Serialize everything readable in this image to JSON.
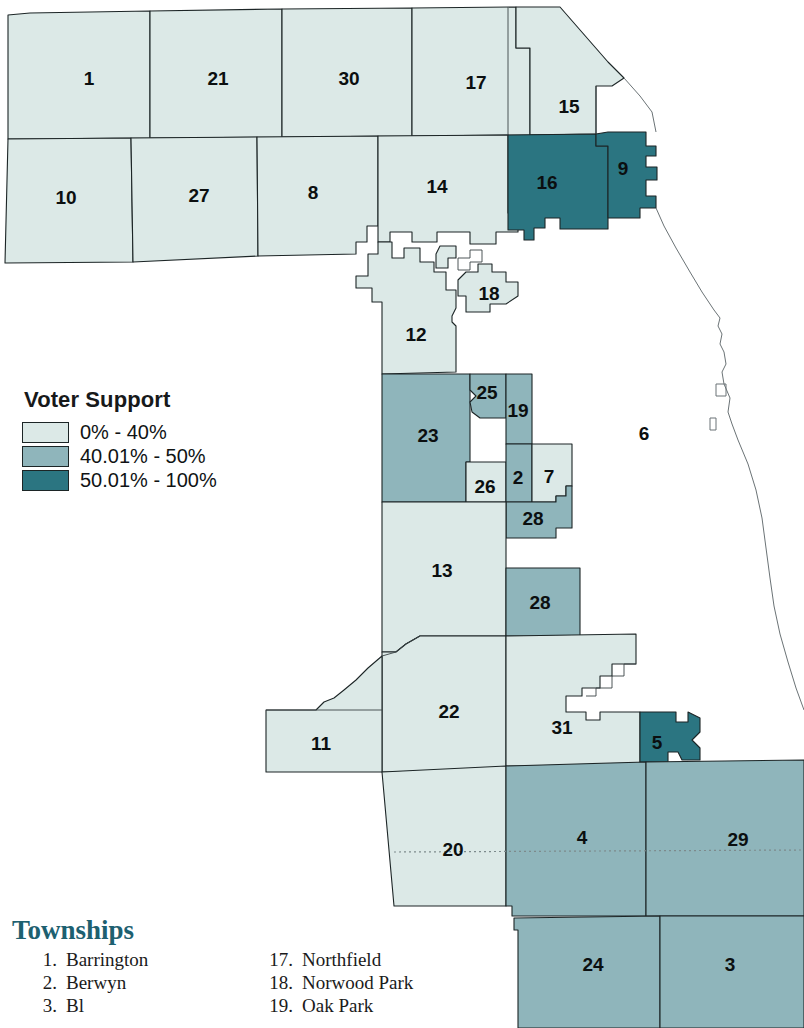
{
  "legend": {
    "title": "Voter Support",
    "entries": [
      {
        "label": "0% - 40%",
        "color": "#dce9e7",
        "level": "low"
      },
      {
        "label": "40.01% - 50%",
        "color": "#8fb5bb",
        "level": "mid"
      },
      {
        "label": "50.01% - 100%",
        "color": "#2b7581",
        "level": "high"
      }
    ]
  },
  "townships": {
    "heading": "Townships",
    "col_left": [
      {
        "num": "1.",
        "name": "Barrington"
      },
      {
        "num": "2.",
        "name": "Berwyn"
      },
      {
        "num": "3.",
        "name": "Bl"
      }
    ],
    "col_right": [
      {
        "num": "17.",
        "name": "Northfield"
      },
      {
        "num": "18.",
        "name": "Norwood Park"
      },
      {
        "num": "19.",
        "name": "Oak Park"
      }
    ]
  },
  "map": {
    "regions": [
      {
        "id": "1",
        "label": "1",
        "level": "low",
        "lx": 89,
        "ly": 80
      },
      {
        "id": "21",
        "label": "21",
        "level": "low",
        "lx": 218,
        "ly": 80
      },
      {
        "id": "30",
        "label": "30",
        "level": "low",
        "lx": 349,
        "ly": 80
      },
      {
        "id": "17",
        "label": "17",
        "level": "low",
        "lx": 476,
        "ly": 84
      },
      {
        "id": "15",
        "label": "15",
        "level": "low",
        "lx": 569,
        "ly": 108
      },
      {
        "id": "10",
        "label": "10",
        "level": "low",
        "lx": 66,
        "ly": 199
      },
      {
        "id": "27",
        "label": "27",
        "level": "low",
        "lx": 199,
        "ly": 197
      },
      {
        "id": "8",
        "label": "8",
        "level": "low",
        "lx": 313,
        "ly": 194
      },
      {
        "id": "14",
        "label": "14",
        "level": "low",
        "lx": 437,
        "ly": 188
      },
      {
        "id": "16",
        "label": "16",
        "level": "high",
        "lx": 547,
        "ly": 184
      },
      {
        "id": "9",
        "label": "9",
        "level": "high",
        "lx": 623,
        "ly": 170
      },
      {
        "id": "18",
        "label": "18",
        "level": "low",
        "lx": 489,
        "ly": 295
      },
      {
        "id": "12",
        "label": "12",
        "level": "low",
        "lx": 416,
        "ly": 336
      },
      {
        "id": "25",
        "label": "25",
        "level": "mid",
        "lx": 487,
        "ly": 394
      },
      {
        "id": "19",
        "label": "19",
        "level": "mid",
        "lx": 518,
        "ly": 412
      },
      {
        "id": "23",
        "label": "23",
        "level": "mid",
        "lx": 428,
        "ly": 437
      },
      {
        "id": "6",
        "label": "6",
        "level": "none",
        "lx": 644,
        "ly": 435
      },
      {
        "id": "26",
        "label": "26",
        "level": "low",
        "lx": 485,
        "ly": 488
      },
      {
        "id": "2",
        "label": "2",
        "level": "mid",
        "lx": 518,
        "ly": 479
      },
      {
        "id": "7",
        "label": "7",
        "level": "low",
        "lx": 549,
        "ly": 478
      },
      {
        "id": "28a",
        "label": "28",
        "level": "mid",
        "lx": 533,
        "ly": 520
      },
      {
        "id": "13",
        "label": "13",
        "level": "low",
        "lx": 442,
        "ly": 572
      },
      {
        "id": "28b",
        "label": "28",
        "level": "mid",
        "lx": 540,
        "ly": 604
      },
      {
        "id": "22",
        "label": "22",
        "level": "low",
        "lx": 449,
        "ly": 713
      },
      {
        "id": "11",
        "label": "11",
        "level": "low",
        "lx": 321,
        "ly": 745
      },
      {
        "id": "31",
        "label": "31",
        "level": "low",
        "lx": 562,
        "ly": 729
      },
      {
        "id": "5",
        "label": "5",
        "level": "high",
        "lx": 657,
        "ly": 744
      },
      {
        "id": "20",
        "label": "20",
        "level": "low",
        "lx": 453,
        "ly": 851
      },
      {
        "id": "4",
        "label": "4",
        "level": "mid",
        "lx": 582,
        "ly": 839
      },
      {
        "id": "29",
        "label": "29",
        "level": "mid",
        "lx": 738,
        "ly": 841
      },
      {
        "id": "24",
        "label": "24",
        "level": "mid",
        "lx": 593,
        "ly": 966
      },
      {
        "id": "3",
        "label": "3",
        "level": "mid",
        "lx": 730,
        "ly": 966
      }
    ]
  }
}
